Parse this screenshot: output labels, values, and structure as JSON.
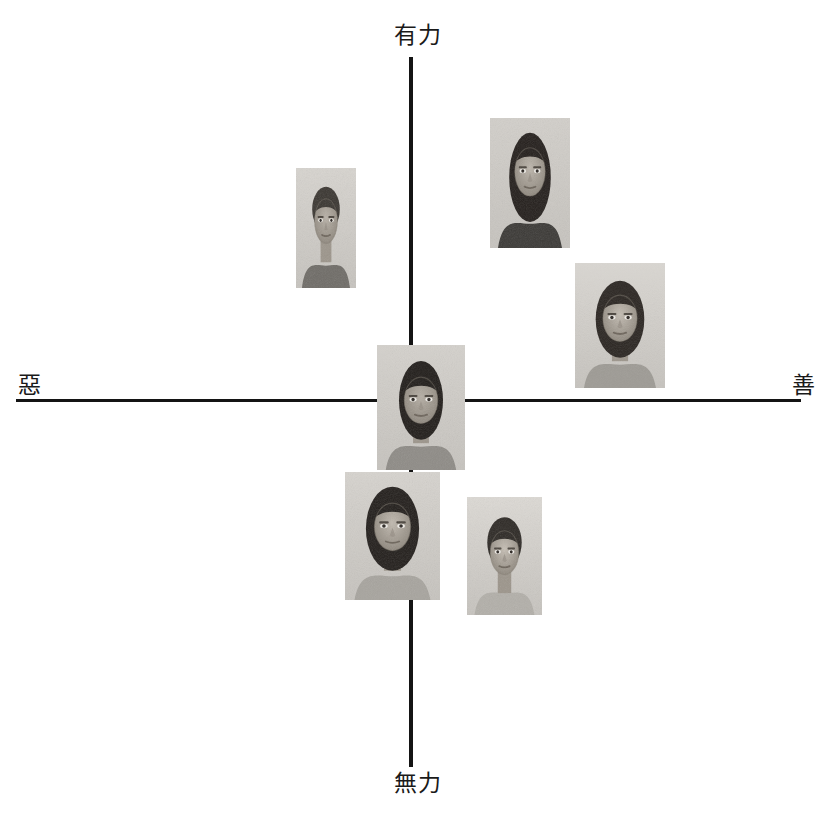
{
  "figure": {
    "type": "scatter",
    "title": "",
    "background_color": "#ffffff",
    "axis_color": "#141414",
    "axes": {
      "vertical": {
        "x": 411,
        "y_top": 57,
        "y_bottom": 767,
        "thickness": 4,
        "top_label": "有力",
        "bottom_label": "無力"
      },
      "horizontal": {
        "y": 399,
        "x_left": 16,
        "x_right": 801,
        "thickness": 3,
        "left_label": "惡",
        "right_label": "善"
      }
    },
    "origin": {
      "x": 411,
      "y": 400
    }
  },
  "labels": {
    "top": "有力",
    "bottom": "無力",
    "left": "惡",
    "right": "善"
  },
  "label_positions": {
    "top": {
      "x": 394,
      "y": 24
    },
    "bottom": {
      "x": 394,
      "y": 772
    },
    "left": {
      "x": 18,
      "y": 374
    },
    "right": {
      "x": 792,
      "y": 374
    }
  },
  "photos": [
    {
      "id": "photo-upper-left",
      "name": "man-curly-hair-upper-left",
      "quadrant": "powerful-evil",
      "x": 296,
      "y": 168,
      "width": 60,
      "height": 120,
      "tone": "#a9a6a1",
      "subject": "male, short curly hair, light shirt"
    },
    {
      "id": "photo-upper-right-a",
      "name": "woman-long-dark-hair-upper",
      "quadrant": "powerful-good",
      "x": 490,
      "y": 118,
      "width": 80,
      "height": 130,
      "tone": "#b0ada7",
      "subject": "female, long dark hair, dark top"
    },
    {
      "id": "photo-upper-right-b",
      "name": "woman-shoulder-length-hair-right",
      "quadrant": "powerful-good",
      "x": 575,
      "y": 263,
      "width": 90,
      "height": 125,
      "tone": "#b4b1ab",
      "subject": "female, shoulder-length dark hair, light top"
    },
    {
      "id": "photo-center",
      "name": "person-center-origin",
      "quadrant": "origin",
      "x": 377,
      "y": 345,
      "width": 88,
      "height": 125,
      "tone": "#aaa7a2",
      "subject": "person, dark wavy hair, neutral position at origin"
    },
    {
      "id": "photo-lower-left",
      "name": "woman-curly-hair-lower",
      "quadrant": "powerless-evil",
      "x": 345,
      "y": 472,
      "width": 95,
      "height": 128,
      "tone": "#adaaa4",
      "subject": "female, dark curly hair, light top"
    },
    {
      "id": "photo-lower-right",
      "name": "woman-short-hair-lower-right",
      "quadrant": "powerless-good",
      "x": 467,
      "y": 497,
      "width": 75,
      "height": 118,
      "tone": "#b6b3ad",
      "subject": "female, short dark hair, light top"
    }
  ],
  "chart_data": {
    "type": "scatter",
    "title": "",
    "xlabel": "惡 — 善",
    "ylabel": "無力 — 有力",
    "axis_labels": {
      "x_negative": "惡",
      "x_positive": "善",
      "y_negative": "無力",
      "y_positive": "有力"
    },
    "xlim": [
      -1,
      1
    ],
    "ylim": [
      -1,
      1
    ],
    "grid": false,
    "legend": null,
    "points": [
      {
        "label": "man-curly-hair-upper-left",
        "x": -0.21,
        "y": 0.58
      },
      {
        "label": "woman-long-dark-hair-upper",
        "x": 0.31,
        "y": 0.7
      },
      {
        "label": "woman-shoulder-length-hair-right",
        "x": 0.55,
        "y": 0.37
      },
      {
        "label": "person-center-origin",
        "x": 0.02,
        "y": 0.0
      },
      {
        "label": "woman-curly-hair-lower",
        "x": -0.04,
        "y": -0.36
      },
      {
        "label": "woman-short-hair-lower-right",
        "x": 0.23,
        "y": -0.48
      }
    ]
  }
}
